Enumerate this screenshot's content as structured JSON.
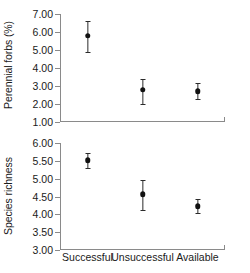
{
  "chart_data": [
    {
      "type": "scatter",
      "panel": "top",
      "title": "",
      "xlabel": "",
      "ylabel": "Perennial forbs (%)",
      "categories": [
        "Successful",
        "Unsuccessful",
        "Available"
      ],
      "values": [
        5.8,
        2.78,
        2.7
      ],
      "error_low": [
        4.9,
        2.02,
        2.28
      ],
      "error_high": [
        6.62,
        3.38,
        3.18
      ],
      "ylim": [
        1.0,
        7.0
      ],
      "ytick_step": 1.0,
      "ytick_labels": [
        "1.00",
        "2.00",
        "3.00",
        "4.00",
        "5.00",
        "6.00",
        "7.00"
      ],
      "ytick_values": [
        1.0,
        2.0,
        3.0,
        4.0,
        5.0,
        6.0,
        7.0
      ],
      "grid": false,
      "legend": false,
      "marker": "filled-circle",
      "errorbar_style": "vertical-line-with-caps"
    },
    {
      "type": "scatter",
      "panel": "bottom",
      "title": "",
      "xlabel": "",
      "ylabel": "Species richness",
      "categories": [
        "Successful",
        "Unsuccessful",
        "Available"
      ],
      "values": [
        5.52,
        4.57,
        4.22
      ],
      "error_low": [
        5.3,
        4.13,
        4.05
      ],
      "error_high": [
        5.72,
        4.97,
        4.42
      ],
      "ylim": [
        3.0,
        6.0
      ],
      "ytick_step": 0.5,
      "ytick_labels": [
        "3.00",
        "3.50",
        "4.00",
        "4.50",
        "5.00",
        "5.50",
        "6.00"
      ],
      "ytick_values": [
        3.0,
        3.5,
        4.0,
        4.5,
        5.0,
        5.5,
        6.0
      ],
      "grid": false,
      "legend": false,
      "marker": "filled-circle",
      "errorbar_style": "vertical-line-with-caps"
    }
  ],
  "colors": {
    "axis": "#8a8a8a",
    "marker": "#111111",
    "errorbar": "#2b2b2b",
    "text": "#1a1a1a",
    "background": "#ffffff"
  }
}
